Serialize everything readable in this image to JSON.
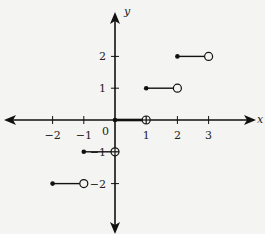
{
  "chart_data": {
    "type": "line",
    "title": "",
    "xlabel": "x",
    "ylabel": "y",
    "origin_label": "0",
    "xlim": [
      -3.5,
      4.3
    ],
    "ylim": [
      -3.5,
      3.3
    ],
    "grid": false,
    "x_ticks": [
      -2,
      -1,
      1,
      2,
      3
    ],
    "x_tick_labels": [
      "−2",
      "−1",
      "1",
      "2",
      "3"
    ],
    "y_ticks": [
      -2,
      -1,
      1,
      2
    ],
    "y_tick_labels": [
      "−2",
      "−1",
      "1",
      "2"
    ],
    "segments": [
      {
        "x_start": -2,
        "x_end": -1,
        "y": -2,
        "start": "closed",
        "end": "open"
      },
      {
        "x_start": -1,
        "x_end": 0,
        "y": -1,
        "start": "closed",
        "end": "open"
      },
      {
        "x_start": 0,
        "x_end": 1,
        "y": 0,
        "start": "closed",
        "end": "open"
      },
      {
        "x_start": 1,
        "x_end": 2,
        "y": 1,
        "start": "closed",
        "end": "open"
      },
      {
        "x_start": 2,
        "x_end": 3,
        "y": 2,
        "start": "closed",
        "end": "open"
      }
    ],
    "colors": {
      "line": "#111111",
      "background": "#f4f4f2"
    }
  }
}
